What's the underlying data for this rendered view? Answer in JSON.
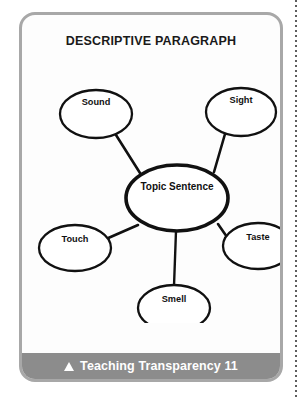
{
  "card": {
    "title": "DESCRIPTIVE PARAGRAPH",
    "border_color": "#a8a8a8",
    "background_color": "#fdfdfd"
  },
  "diagram": {
    "type": "web-cluster-map",
    "center": {
      "label": "Topic Sentence",
      "cx": 155,
      "cy": 145,
      "rx": 51,
      "ry": 33
    },
    "nodes": [
      {
        "id": "sound",
        "label": "Sound",
        "cx": 74,
        "cy": 61,
        "rx": 36,
        "ry": 24
      },
      {
        "id": "sight",
        "label": "Sight",
        "cx": 219,
        "cy": 59,
        "rx": 35,
        "ry": 24
      },
      {
        "id": "touch",
        "label": "Touch",
        "cx": 53,
        "cy": 195,
        "rx": 36,
        "ry": 23
      },
      {
        "id": "taste",
        "label": "Taste",
        "cx": 236,
        "cy": 193,
        "rx": 35,
        "ry": 23
      },
      {
        "id": "smell",
        "label": "Smell",
        "cx": 152,
        "cy": 255,
        "rx": 36,
        "ry": 23
      }
    ],
    "connections": [
      {
        "from": "center",
        "to": "sound"
      },
      {
        "from": "center",
        "to": "sight"
      },
      {
        "from": "center",
        "to": "touch"
      },
      {
        "from": "center",
        "to": "taste"
      },
      {
        "from": "center",
        "to": "smell"
      }
    ]
  },
  "footer": {
    "marker_icon": "up-triangle-icon",
    "text": "Teaching Transparency 11",
    "background_color": "#8c8c8c",
    "text_color": "#ffffff"
  },
  "decor": {
    "dotted_rule_name": "dotted-rule",
    "dotted_rule_color": "#5d5d5d"
  }
}
